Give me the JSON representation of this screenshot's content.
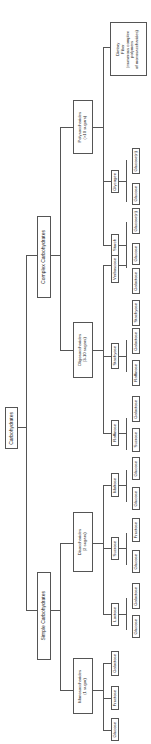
{
  "title": "Carbohydrates",
  "root": {
    "label": "Carbohydrates"
  },
  "level1": {
    "complex": {
      "label": "Complex Carbohydrates"
    },
    "simple": {
      "label": "Simple Carbohydrates"
    }
  },
  "level2": {
    "poly": {
      "line1": "Polysaccharides",
      "line2": "(>10 sugars)"
    },
    "oligo": {
      "line1": "Oligosaccharides",
      "line2": "(3-10 sugars)"
    },
    "di": {
      "line1": "Disaccharides",
      "line2": "(2 sugars)"
    },
    "mono": {
      "line1": "Monosaccharides",
      "line2": "(1 sugar)"
    }
  },
  "level3": {
    "fiber": {
      "line1": "Dietary",
      "line2": "Fiber",
      "line3": "(numerous complex",
      "line4": "polymers",
      "line5": "of monosaccharides)"
    },
    "glycogen": {
      "label": "Glycogen"
    },
    "starch": {
      "label": "Starch"
    },
    "verbascose": {
      "label": "Verbascose"
    },
    "stachyose": {
      "label": "Stachyose"
    },
    "raffinose": {
      "label": "Raffinose"
    },
    "maltose": {
      "label": "Maltose"
    },
    "sucrose": {
      "label": "Sucrose"
    },
    "lactose": {
      "label": "Lactose"
    },
    "galactose": {
      "label": "Galactose"
    },
    "fructose": {
      "label": "Fructose"
    },
    "glucose": {
      "label": "Glucose"
    }
  },
  "level4": {
    "glycogen": [
      "Glucose",
      "Glucose(n)"
    ],
    "starch": [
      "Glucose",
      "Glucose(n)"
    ],
    "verbascose": [
      "Stachyose",
      "Galactose"
    ],
    "stachyose": [
      "Raffinose",
      "Galactose"
    ],
    "raffinose": [
      "Sucrose",
      "Galactose"
    ],
    "maltose": [
      "Glucose",
      "Glucose"
    ],
    "sucrose": [
      "Glucose",
      "Fructose"
    ],
    "lactose": [
      "Glucose",
      "Galactose"
    ]
  }
}
